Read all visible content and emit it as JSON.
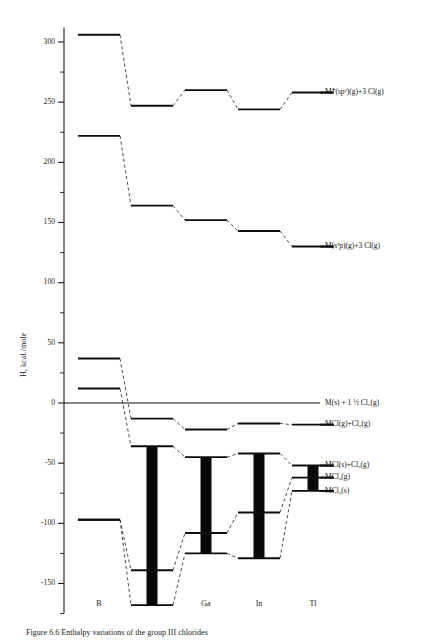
{
  "figure": {
    "caption": "Figure 6.6  Enthalpy variations of the group III chlorides",
    "axis": {
      "ylabel": "H, kcal./mole",
      "ymin": -175,
      "ymax": 312,
      "major_ticks": [
        300,
        250,
        200,
        150,
        100,
        50,
        0,
        -50,
        -100,
        -150
      ],
      "major_tick_labels": [
        "300",
        "250",
        "200",
        "150",
        "100",
        "50",
        "0",
        "-50",
        "-100",
        "-150"
      ],
      "minor_ticks": [
        275,
        225,
        175,
        125,
        75,
        25,
        -25,
        -75,
        -125,
        -175
      ],
      "xcategories": [
        "B",
        "Al",
        "Ga",
        "In",
        "Tl"
      ]
    }
  },
  "chart_data": {
    "type": "line",
    "xlabel": "",
    "ylabel": "H, kcal./mole",
    "ylim": [
      -175,
      312
    ],
    "grid": false,
    "legend": "right-inline-labels",
    "categories": [
      "B",
      "Al",
      "Ga",
      "In",
      "Tl"
    ],
    "series": [
      {
        "name": "M*(sp2)(g)+3 Cl(g)",
        "label": "M*(sp²)(g)+3 Cl(g)",
        "values": [
          306,
          247,
          260,
          244,
          258
        ],
        "label_at": "Tl"
      },
      {
        "name": "M(s2p)(g)+3 Cl(g)",
        "label": "M(s²p)(g)+3 Cl(g)",
        "values": [
          222,
          164,
          152,
          143,
          130
        ],
        "label_at": "Tl"
      },
      {
        "name": "M(s)+1 1/2 Cl2(g)",
        "label": "M(s) + 1 ½ Cl₂(g)",
        "values": [
          0,
          0,
          0,
          0,
          0
        ],
        "label_at": "Tl"
      },
      {
        "name": "MCl(g)+Cl2(g)",
        "label": "MCl(g)+Cl₂(g)",
        "values": [
          37,
          -13,
          -22,
          -17,
          -18
        ],
        "label_at": "Tl"
      },
      {
        "name": "MCl(s)+Cl2(g)",
        "label": "MCl(s)+Cl₂(g)",
        "values": [
          12,
          -36,
          -45,
          -42,
          -52
        ],
        "label_at": "Tl"
      },
      {
        "name": "MCl3(g)",
        "label": "MCl₃(g)",
        "values": [
          -97,
          -139,
          -108,
          -91,
          -62
        ],
        "label_at": "Tl"
      },
      {
        "name": "MCl3(s)",
        "label": "MCl₃(s)",
        "values": [
          -97,
          -168,
          -125,
          -129,
          -73
        ],
        "label_at": "Tl"
      }
    ],
    "bars": [
      {
        "category": "Al",
        "top": -36,
        "bottom": -168,
        "note": "sublimation/formation span"
      },
      {
        "category": "Ga",
        "top": -45,
        "bottom": -125,
        "note": "sublimation/formation span"
      },
      {
        "category": "In",
        "top": -42,
        "bottom": -129,
        "note": "sublimation/formation span"
      },
      {
        "category": "Tl",
        "top": -52,
        "bottom": -73,
        "note": "sublimation/formation span"
      }
    ]
  }
}
